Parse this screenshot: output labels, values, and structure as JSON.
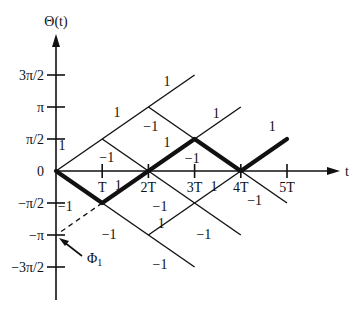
{
  "diagram": {
    "y_axis_label": "Θ(t)",
    "x_axis_label": "t",
    "y_ticks": [
      {
        "label": "3π/2",
        "value": 1.5
      },
      {
        "label": "π",
        "value": 1.0
      },
      {
        "label": "π/2",
        "value": 0.5
      },
      {
        "label": "0",
        "value": 0
      },
      {
        "label": "−π/2",
        "value": -0.5
      },
      {
        "label": "−π",
        "value": -1.0
      },
      {
        "label": "−3π/2",
        "value": -1.5
      }
    ],
    "x_ticks": [
      {
        "label": "T",
        "value": 1
      },
      {
        "label": "2T",
        "value": 2
      },
      {
        "label": "3T",
        "value": 3
      },
      {
        "label": "4T",
        "value": 4
      },
      {
        "label": "5T",
        "value": 5
      }
    ],
    "thin_branches": [
      {
        "from": [
          0,
          0
        ],
        "to": [
          3,
          1.5
        ]
      },
      {
        "from": [
          1,
          0.5
        ],
        "to": [
          2,
          0
        ]
      },
      {
        "from": [
          2,
          1.0
        ],
        "to": [
          3,
          0.5
        ]
      },
      {
        "from": [
          3,
          0.5
        ],
        "to": [
          4,
          1.0
        ]
      },
      {
        "from": [
          1,
          -0.5
        ],
        "to": [
          3,
          -1.5
        ]
      },
      {
        "from": [
          2,
          0
        ],
        "to": [
          4,
          -1.0
        ]
      },
      {
        "from": [
          2,
          -1.0
        ],
        "to": [
          4,
          0
        ]
      },
      {
        "from": [
          4,
          0
        ],
        "to": [
          5,
          -0.5
        ]
      }
    ],
    "bold_path": [
      [
        0,
        0
      ],
      [
        1,
        -0.5
      ],
      [
        2,
        0
      ],
      [
        3,
        0.5
      ],
      [
        4,
        0
      ],
      [
        5,
        0.5
      ]
    ],
    "dashed_line": {
      "from": [
        1,
        -0.5
      ],
      "to": [
        0,
        -1.0
      ]
    },
    "branch_labels": [
      {
        "text": "1",
        "t": 0.13,
        "v": 0.4
      },
      {
        "text": "1",
        "t": 1.32,
        "v": 0.92
      },
      {
        "text": "1",
        "t": 2.4,
        "v": 1.4
      },
      {
        "text": "−1",
        "t": 1.1,
        "v": 0.22
      },
      {
        "text": "−1",
        "t": 2.05,
        "v": 0.7
      },
      {
        "text": "1",
        "t": 2.4,
        "v": 0.46
      },
      {
        "text": "1",
        "t": 3.47,
        "v": 0.9
      },
      {
        "text": "−1",
        "t": 2.95,
        "v": 0.2
      },
      {
        "text": "1",
        "t": 4.68,
        "v": 0.7
      },
      {
        "text": "−1",
        "t": 0.2,
        "v": -0.55
      },
      {
        "text": "1",
        "t": 1.35,
        "v": -0.22
      },
      {
        "text": "−1",
        "t": 2.25,
        "v": -0.55
      },
      {
        "text": "1",
        "t": 2.28,
        "v": -0.82
      },
      {
        "text": "−1",
        "t": 1.15,
        "v": -0.98
      },
      {
        "text": "−1",
        "t": 3.2,
        "v": -0.98
      },
      {
        "text": "−1",
        "t": 2.25,
        "v": -1.45
      },
      {
        "text": "−1",
        "t": 4.3,
        "v": -0.45
      },
      {
        "text": "1",
        "t": 3.42,
        "v": -0.24
      }
    ],
    "annotation": {
      "label": "Φ",
      "subscript": "1",
      "points_to": [
        0,
        -1.0
      ]
    }
  }
}
